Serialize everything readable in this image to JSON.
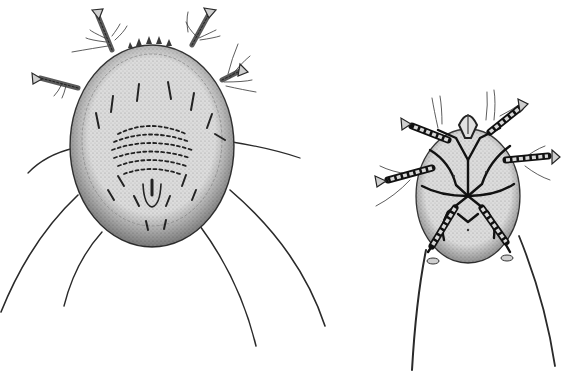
{
  "image": {
    "width": 569,
    "height": 374,
    "style": "monochrome engraving-style scientific illustration",
    "background_color": "#ffffff",
    "ink_color": "#1e1e1e",
    "body_fill_color": "#d9d9d9"
  },
  "subjects": [
    {
      "id": "mite-dorsal",
      "description": "mite, dorsal view, oval stippled body with rows of short spines and four long posterior setae",
      "body": {
        "cx": 152,
        "cy": 146,
        "rx": 82,
        "ry": 101
      },
      "front_leg_tips": [
        [
          97,
          12
        ],
        [
          210,
          10
        ],
        [
          35,
          78
        ],
        [
          245,
          70
        ]
      ],
      "long_setae_ends": [
        [
          0,
          312
        ],
        [
          64,
          306
        ],
        [
          256,
          346
        ],
        [
          325,
          326
        ]
      ],
      "side_setae_ends": [
        [
          28,
          172
        ],
        [
          300,
          158
        ]
      ]
    },
    {
      "id": "mite-ventral",
      "description": "mite, ventral view, smaller oval body with dark segmented legs and apodemes, two long posterior setae",
      "body": {
        "cx": 468,
        "cy": 195,
        "rx": 52,
        "ry": 68
      },
      "front_leg_tips": [
        [
          405,
          124
        ],
        [
          522,
          104
        ],
        [
          380,
          181
        ],
        [
          556,
          159
        ]
      ],
      "long_setae_ends": [
        [
          412,
          370
        ],
        [
          555,
          366
        ]
      ]
    }
  ]
}
